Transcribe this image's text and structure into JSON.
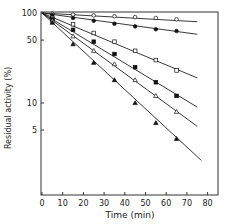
{
  "chart_data": {
    "type": "line",
    "title": "",
    "xlabel": "Time (min)",
    "ylabel": "Residual activity (%)",
    "xlim": [
      0,
      85
    ],
    "ylim": [
      1.5,
      100
    ],
    "yscale": "log",
    "grid": false,
    "legend": null,
    "x_ticks": [
      0,
      10,
      20,
      30,
      40,
      50,
      60,
      70,
      80
    ],
    "y_ticks": [
      100,
      50,
      10,
      5
    ],
    "series": [
      {
        "name": "series-1",
        "marker": "open-circle",
        "x": [
          0,
          5,
          15,
          25,
          35,
          45,
          55,
          65
        ],
        "values": [
          100,
          98,
          96,
          94,
          92,
          90,
          88,
          85
        ],
        "fit_end": [
          75,
          80
        ]
      },
      {
        "name": "series-2",
        "marker": "filled-circle",
        "x": [
          0,
          5,
          15,
          25,
          35,
          45,
          55,
          65
        ],
        "values": [
          100,
          95,
          88,
          82,
          76,
          71,
          66,
          63
        ],
        "fit_end": [
          75,
          58
        ]
      },
      {
        "name": "series-3",
        "marker": "open-square",
        "x": [
          0,
          5,
          15,
          25,
          35,
          45,
          55,
          65
        ],
        "values": [
          100,
          88,
          75,
          60,
          48,
          38,
          30,
          23
        ],
        "fit_end": [
          75,
          19
        ]
      },
      {
        "name": "series-4",
        "marker": "filled-square",
        "x": [
          0,
          5,
          15,
          25,
          35,
          45,
          55,
          65
        ],
        "values": [
          100,
          85,
          65,
          48,
          35,
          25,
          17,
          12
        ],
        "fit_end": [
          75,
          9
        ]
      },
      {
        "name": "series-5",
        "marker": "open-triangle",
        "x": [
          0,
          5,
          15,
          25,
          35,
          45,
          55,
          65
        ],
        "values": [
          100,
          82,
          55,
          38,
          27,
          18,
          12,
          8
        ],
        "fit_end": [
          75,
          5.5
        ]
      },
      {
        "name": "series-6",
        "marker": "filled-triangle",
        "x": [
          0,
          5,
          15,
          25,
          35,
          45,
          55,
          65
        ],
        "values": [
          100,
          78,
          45,
          28,
          18,
          10,
          6,
          4
        ],
        "fit_end": [
          77,
          2.3
        ]
      }
    ]
  }
}
